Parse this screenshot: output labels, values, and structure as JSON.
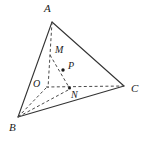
{
  "figure": {
    "type": "geometry-diagram",
    "shape": "tetrahedron",
    "stroke_color": "#333333",
    "dash_color": "#4a4a4a",
    "background_color": "#ffffff",
    "point_marker_color": "#1a1a1a",
    "labels": {
      "a": "A",
      "b": "B",
      "c": "C",
      "o": "O",
      "m": "M",
      "p": "P",
      "n": "N"
    },
    "points": {
      "a": {
        "x": 52,
        "y": 22
      },
      "b": {
        "x": 18,
        "y": 117
      },
      "c": {
        "x": 124,
        "y": 86
      },
      "o": {
        "x": 47,
        "y": 87
      },
      "m": {
        "x": 51,
        "y": 56
      },
      "p": {
        "x": 63,
        "y": 70
      },
      "n": {
        "x": 69,
        "y": 88
      }
    },
    "label_positions": {
      "a": {
        "x": 44,
        "y": 4
      },
      "b": {
        "x": 10,
        "y": 123
      },
      "c": {
        "x": 131,
        "y": 84
      },
      "o": {
        "x": 33,
        "y": 80
      },
      "m": {
        "x": 55,
        "y": 46
      },
      "p": {
        "x": 68,
        "y": 62
      },
      "n": {
        "x": 72,
        "y": 91
      }
    },
    "solid_edges": [
      {
        "name": "edge-ab",
        "from": "a",
        "to": "b"
      },
      {
        "name": "edge-ac",
        "from": "a",
        "to": "c"
      },
      {
        "name": "edge-bc",
        "from": "b",
        "to": "c"
      }
    ],
    "dashed_edges": [
      {
        "name": "edge-ao",
        "from": "a",
        "to": "o"
      },
      {
        "name": "edge-bo",
        "from": "b",
        "to": "o"
      },
      {
        "name": "edge-oc",
        "from": "o",
        "to": "c"
      },
      {
        "name": "edge-mn",
        "from": "m",
        "to": "n"
      },
      {
        "name": "edge-bn",
        "from": "b",
        "to": "n"
      }
    ],
    "marked_points": [
      "p",
      "n"
    ]
  }
}
